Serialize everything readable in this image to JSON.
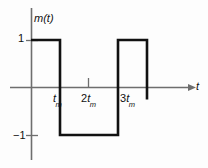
{
  "chart_data": {
    "type": "line",
    "title": "",
    "subtitle": "",
    "xlabel": "t",
    "ylabel": "m(t)",
    "grid": false,
    "legend": false,
    "xlim": [
      0,
      4
    ],
    "ylim": [
      -1,
      1
    ],
    "x_unit": "t_m",
    "x_tick_labels": [
      "t",
      "2t",
      "3t"
    ],
    "x_tick_subscripts": [
      "m",
      "m",
      "m"
    ],
    "x_tick_prefixes": [
      "",
      "2",
      "3"
    ],
    "x_tick_values": [
      1,
      2,
      3
    ],
    "y_tick_labels": [
      "1",
      "-1"
    ],
    "y_tick_values": [
      1,
      -1
    ],
    "series": [
      {
        "name": "m(t)",
        "color": "#111111",
        "points": [
          {
            "x": 0,
            "y": 1
          },
          {
            "x": 1,
            "y": 1
          },
          {
            "x": 1,
            "y": -1
          },
          {
            "x": 3,
            "y": -1
          },
          {
            "x": 3,
            "y": 1
          },
          {
            "x": 4,
            "y": 1
          },
          {
            "x": 4,
            "y": -0.25
          }
        ]
      }
    ]
  },
  "labels": {
    "y_axis_name": "m(t)",
    "y_axis_name_m": "m(",
    "y_axis_name_t": "t",
    "y_axis_name_close": ")",
    "x_axis_name": "t",
    "y_pos_one": "1",
    "y_neg_one": "−1",
    "tick_1_prefix": "",
    "tick_1_base": "t",
    "tick_1_sub": "m",
    "tick_2_prefix": "2",
    "tick_2_base": "t",
    "tick_2_sub": "m",
    "tick_3_prefix": "3",
    "tick_3_base": "t",
    "tick_3_sub": "m"
  },
  "colors": {
    "background": "#fdfdfd",
    "waveform": "#111111",
    "axis": "#6e6e6e",
    "text": "#111111"
  }
}
